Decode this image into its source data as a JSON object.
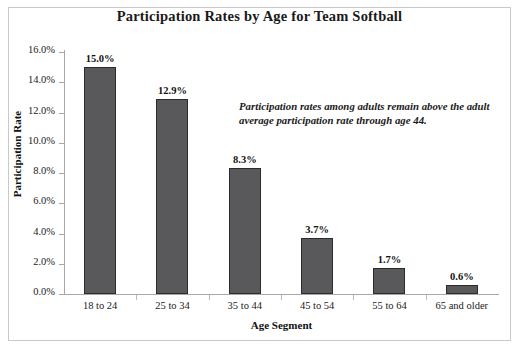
{
  "chart_data": {
    "type": "bar",
    "title": "Participation Rates by Age for Team Softball",
    "xlabel": "Age Segment",
    "ylabel": "Participation Rate",
    "categories": [
      "18 to 24",
      "25 to 34",
      "35 to 44",
      "45 to 54",
      "55 to 64",
      "65 and older"
    ],
    "values": [
      15.0,
      12.9,
      8.3,
      3.7,
      1.7,
      0.6
    ],
    "value_labels": [
      "15.0%",
      "12.9%",
      "8.3%",
      "3.7%",
      "1.7%",
      "0.6%"
    ],
    "ylim": [
      0.0,
      16.0
    ],
    "ytick_values": [
      0.0,
      2.0,
      4.0,
      6.0,
      8.0,
      10.0,
      12.0,
      14.0,
      16.0
    ],
    "ytick_labels": [
      "0.0%",
      "2.0%",
      "4.0%",
      "6.0%",
      "8.0%",
      "10.0%",
      "12.0%",
      "14.0%",
      "16.0%"
    ],
    "grid": false,
    "legend": false,
    "annotations": [
      {
        "text": "Participation rates among adults remain above the adult average participation rate through age 44.",
        "style": "bold-italic"
      }
    ],
    "colors": {
      "bar_fill": "#59595b",
      "bar_border": "#2b2b2b",
      "axis": "#a8a8a8",
      "text": "#1a1a1a",
      "background": "#ffffff",
      "frame_border": "#c9c9c9"
    }
  }
}
